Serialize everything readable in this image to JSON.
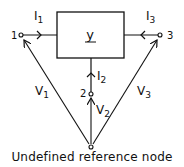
{
  "diagram": {
    "block_label": "y",
    "nodes": [
      {
        "id": "node-1",
        "label": "1"
      },
      {
        "id": "node-2",
        "label": "2"
      },
      {
        "id": "node-3",
        "label": "3"
      },
      {
        "id": "node-ref",
        "label": ""
      }
    ],
    "currents": {
      "i1": "I",
      "i1_sub": "1",
      "i2": "I",
      "i2_sub": "2",
      "i3": "I",
      "i3_sub": "3"
    },
    "voltages": {
      "v1": "V",
      "v1_sub": "1",
      "v2": "V",
      "v2_sub": "2",
      "v3": "V",
      "v3_sub": "3"
    },
    "caption": "Undefined reference node"
  }
}
